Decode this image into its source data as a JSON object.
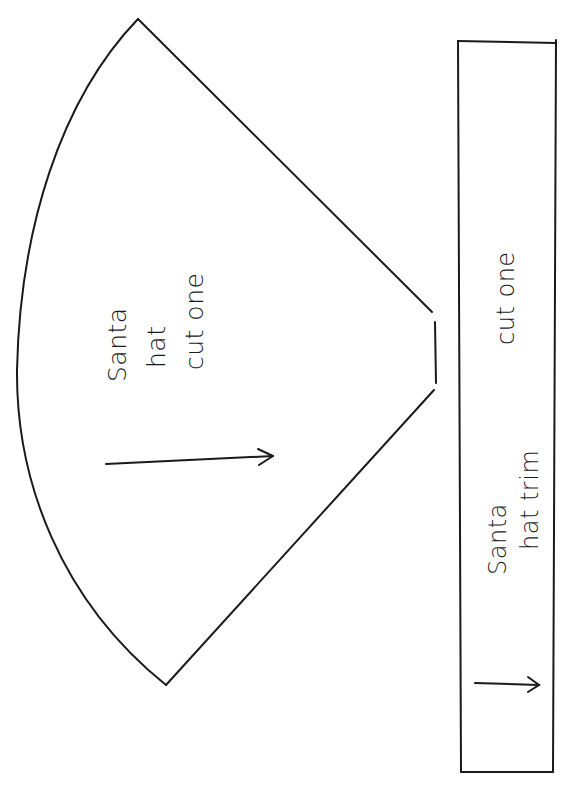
{
  "pattern_sheet": {
    "hat_piece": {
      "label_line1": "Santa",
      "label_line2": "hat",
      "label_line3": "cut one",
      "shape": "cone-sector",
      "grainline_icon": "arrow-right-icon"
    },
    "trim_piece": {
      "label_line1": "Santa",
      "label_line2": "hat trim",
      "cut_instruction": "cut one",
      "shape": "rectangle",
      "grainline_icon": "arrow-right-icon"
    },
    "colors": {
      "line": "#1a1a1a",
      "background": "#ffffff"
    }
  }
}
